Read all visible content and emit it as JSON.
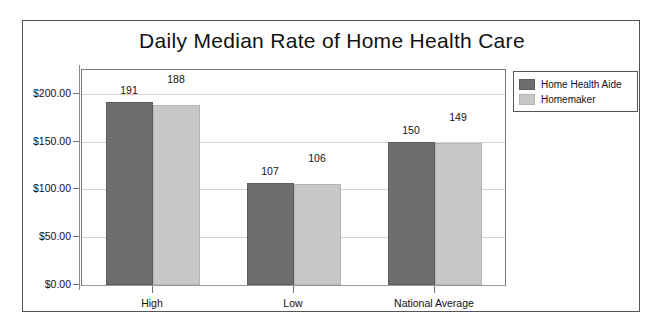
{
  "chart_data": {
    "type": "bar",
    "title": "Daily Median Rate of Home Health Care",
    "xlabel": "",
    "ylabel": "",
    "categories": [
      "High",
      "Low",
      "National Average"
    ],
    "series": [
      {
        "name": "Home Health Aide",
        "color": "#6e6e6e",
        "values": [
          191,
          107,
          150
        ]
      },
      {
        "name": "Homemaker",
        "color": "#c8c8c8",
        "values": [
          188,
          106,
          149
        ]
      }
    ],
    "ylim": [
      0,
      225
    ],
    "yticks": [
      0,
      50,
      100,
      150,
      200
    ],
    "ytick_labels": [
      "$0.00",
      "$50.00",
      "$100.00",
      "$150.00",
      "$200.00"
    ],
    "grid": true,
    "legend_position": "right-top",
    "data_labels": [
      [
        "191",
        "188"
      ],
      [
        "107",
        "106"
      ],
      [
        "150",
        "149"
      ]
    ]
  },
  "frame": {
    "border_color": "#555555",
    "background": "#ffffff"
  }
}
